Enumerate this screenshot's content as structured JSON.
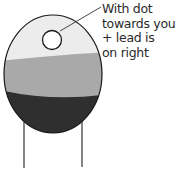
{
  "diagram": {
    "annotation": {
      "lines": [
        "With dot",
        "towards you",
        "+ lead is",
        "on right"
      ]
    },
    "colors": {
      "top_band": "#ececec",
      "middle_band": "#a9a9a9",
      "bottom_band": "#2f2f2f",
      "outline": "#1a1a1a",
      "dot_fill": "#ffffff",
      "leads": "#444444",
      "text": "#2a2a2a"
    }
  }
}
